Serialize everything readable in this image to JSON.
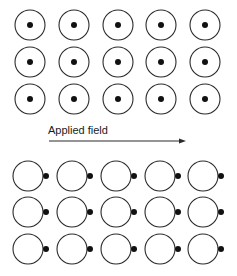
{
  "diagram": {
    "arrow_label": "Applied field",
    "colors": {
      "stroke": "#2a2a2a",
      "dot": "#111111",
      "background": "#ffffff"
    },
    "top_grid": {
      "description": "Atoms with electron cloud centered on nucleus (no field)",
      "rows": 3,
      "cols": 5,
      "x": [
        30,
        74,
        118,
        161,
        205
      ],
      "y": [
        25,
        62,
        99
      ],
      "radius": 15,
      "dot_offset": 0,
      "dot_radius": 3
    },
    "bottom_grid": {
      "description": "Polarized atoms: nucleus displaced toward applied field direction",
      "rows": 3,
      "cols": 5,
      "x": [
        28,
        72,
        116,
        160,
        203
      ],
      "y": [
        176,
        212,
        249
      ],
      "radius": 15,
      "dot_offset": 18,
      "dot_radius": 3
    },
    "arrow": {
      "x1": 49,
      "x2": 186,
      "y": 141
    }
  }
}
